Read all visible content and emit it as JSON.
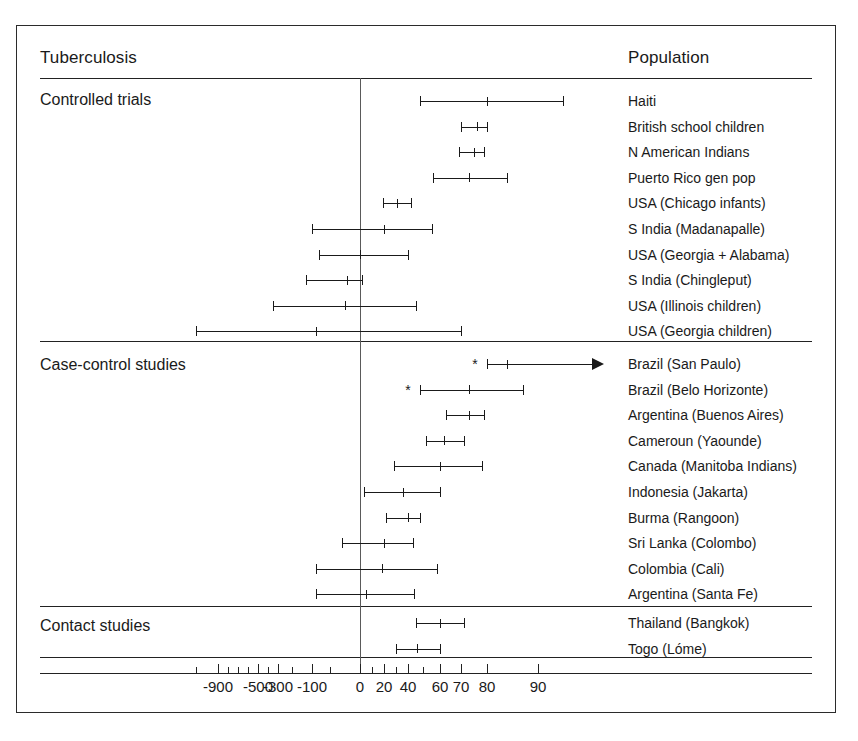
{
  "figure": {
    "column_headers": {
      "left": "Tuberculosis",
      "right": "Population"
    },
    "sections": [
      {
        "id": "controlled-trials",
        "label": "Controlled trials"
      },
      {
        "id": "case-control-studies",
        "label": "Case-control studies"
      },
      {
        "id": "contact-studies",
        "label": "Contact studies"
      }
    ]
  },
  "chart_data": {
    "type": "forest",
    "title": "Tuberculosis",
    "xlabel": "",
    "ylabel": "Population",
    "null_value": 0,
    "grid": false,
    "legend": "none",
    "axis": {
      "tick_labels": [
        "-900",
        "-500",
        "-300",
        "-100",
        "0",
        "20",
        "40",
        "60",
        "70",
        "80",
        "90"
      ],
      "labeled_tick_values": [
        -900,
        -500,
        -300,
        -100,
        0,
        20,
        40,
        60,
        70,
        80,
        90
      ],
      "all_tick_values": [
        -1100,
        -900,
        -800,
        -700,
        -600,
        -500,
        -400,
        -300,
        -200,
        -100,
        -50,
        0,
        10,
        20,
        30,
        40,
        50,
        60,
        70,
        80,
        90
      ],
      "scale": "efficacy (nonlinear, percent)",
      "range": [
        -1200,
        100
      ]
    },
    "groups": [
      {
        "name": "Controlled trials",
        "rows": [
          {
            "population": "Haiti",
            "estimate": 80,
            "low": 48,
            "high": 93,
            "marker": "none"
          },
          {
            "population": "British school children",
            "estimate": 76,
            "low": 70,
            "high": 80,
            "marker": "none"
          },
          {
            "population": "N American Indians",
            "estimate": 75,
            "low": 69,
            "high": 79,
            "marker": "none"
          },
          {
            "population": "Puerto Rico gen pop",
            "estimate": 73,
            "low": 56,
            "high": 84,
            "marker": "none"
          },
          {
            "population": "USA (Chicago infants)",
            "estimate": 31,
            "low": 19,
            "high": 42,
            "marker": "none"
          },
          {
            "population": "S India (Madanapalle)",
            "estimate": 20,
            "low": -100,
            "high": 55,
            "marker": "none"
          },
          {
            "population": "USA (Georgia + Alabama)",
            "estimate": 0,
            "low": -80,
            "high": 40,
            "marker": "none"
          },
          {
            "population": "S India (Chingleput)",
            "estimate": -22,
            "low": -130,
            "high": 2,
            "marker": "none"
          },
          {
            "population": "USA (Illinois children)",
            "estimate": -25,
            "low": -350,
            "high": 45,
            "marker": "none"
          },
          {
            "population": "USA (Georgia children)",
            "estimate": -90,
            "low": -1100,
            "high": 70,
            "marker": "none"
          }
        ]
      },
      {
        "name": "Case-control studies",
        "rows": [
          {
            "population": "Brazil (San Paulo)",
            "estimate": 84,
            "low": 80,
            "high": 98,
            "marker": "star-and-arrow"
          },
          {
            "population": "Brazil (Belo Horizonte)",
            "estimate": 73,
            "low": 48,
            "high": 87,
            "marker": "star"
          },
          {
            "population": "Argentina (Buenos Aires)",
            "estimate": 73,
            "low": 63,
            "high": 79,
            "marker": "none"
          },
          {
            "population": "Cameroun (Yaounde)",
            "estimate": 62,
            "low": 52,
            "high": 71,
            "marker": "none"
          },
          {
            "population": "Canada (Manitoba Indians)",
            "estimate": 60,
            "low": 28,
            "high": 78,
            "marker": "none"
          },
          {
            "population": "Indonesia (Jakarta)",
            "estimate": 36,
            "low": 3,
            "high": 60,
            "marker": "none"
          },
          {
            "population": "Burma (Rangoon)",
            "estimate": 40,
            "low": 22,
            "high": 48,
            "marker": "none"
          },
          {
            "population": "Sri Lanka (Colombo)",
            "estimate": 20,
            "low": -30,
            "high": 43,
            "marker": "none"
          },
          {
            "population": "Colombia (Cali)",
            "estimate": 18,
            "low": -90,
            "high": 58,
            "marker": "none"
          },
          {
            "population": "Argentina (Santa Fe)",
            "estimate": 5,
            "low": -90,
            "high": 44,
            "marker": "none"
          }
        ]
      },
      {
        "name": "Contact studies",
        "rows": [
          {
            "population": "Thailand (Bangkok)",
            "estimate": 60,
            "low": 45,
            "high": 71,
            "marker": "none"
          },
          {
            "population": "Togo (Lóme)",
            "estimate": 46,
            "low": 30,
            "high": 60,
            "marker": "none"
          }
        ]
      }
    ]
  }
}
